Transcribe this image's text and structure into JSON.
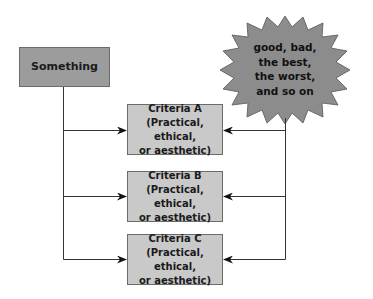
{
  "diagram": {
    "source": {
      "label": "Something"
    },
    "judgments": {
      "lines": [
        "good, bad,",
        "the best,",
        "the worst,",
        "and so on"
      ]
    },
    "criteria": [
      {
        "title": "Criteria A",
        "line2": "(Practical, ethical,",
        "line3": "or aesthetic)"
      },
      {
        "title": "Criteria B",
        "line2": "(Practical, ethical,",
        "line3": "or aesthetic)"
      },
      {
        "title": "Criteria C",
        "line2": "(Practical, ethical,",
        "line3": "or aesthetic)"
      }
    ],
    "colors": {
      "source_fill": "#9c9c9c",
      "criteria_fill": "#c9c9c9",
      "burst_fill": "#8c8c8c",
      "line": "#333333"
    }
  }
}
